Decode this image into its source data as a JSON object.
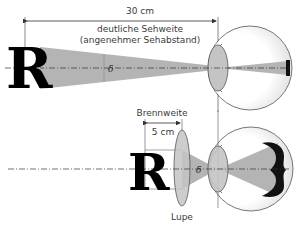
{
  "top_diagram": {
    "distance_label": "30 cm",
    "caption_line1": "deutliche Sehweite",
    "caption_line2": "(angenehmer Sehabstand)",
    "object_letter": "R",
    "angle_symbol": "δ"
  },
  "bottom_diagram": {
    "focal_label": "Brennweite",
    "distance_label": "5 cm",
    "lens_label": "Lupe",
    "object_letter": "R",
    "angle_symbol": "δ"
  },
  "colors": {
    "cone_fill": "#b4b4b4",
    "lens_fill": "#c4c4c4",
    "line": "#444444",
    "text": "#3a3a3a"
  }
}
